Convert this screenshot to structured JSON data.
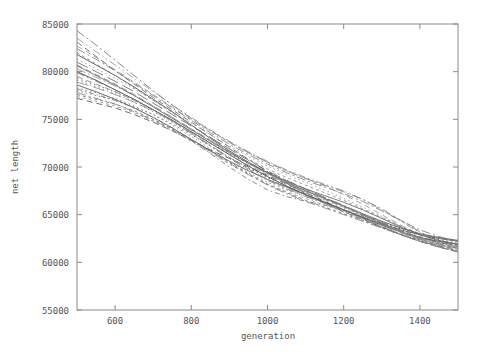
{
  "chart_data": {
    "type": "line",
    "title": "",
    "xlabel": "generation",
    "ylabel": "net length",
    "xlim": [
      500,
      1500
    ],
    "ylim": [
      55000,
      85000
    ],
    "xticks": [
      600,
      800,
      1000,
      1200,
      1400
    ],
    "yticks": [
      55000,
      60000,
      65000,
      70000,
      75000,
      80000,
      85000
    ],
    "xtick_labels": [
      "600",
      "800",
      "1000",
      "1200",
      "1400"
    ],
    "ytick_labels": [
      "55000",
      "60000",
      "65000",
      "70000",
      "75000",
      "80000",
      "85000"
    ],
    "grid": false,
    "legend": false,
    "legend_position": "none",
    "x": [
      500,
      550,
      600,
      650,
      700,
      750,
      800,
      850,
      900,
      950,
      1000,
      1050,
      1100,
      1150,
      1200,
      1250,
      1300,
      1350,
      1400,
      1450,
      1500
    ],
    "series": [
      {
        "name": "run-1",
        "style": "solid",
        "color": "#3a3a3a",
        "values": [
          80000,
          79100,
          78100,
          77100,
          76000,
          74900,
          73700,
          72500,
          71300,
          70100,
          69000,
          68000,
          67100,
          66300,
          65500,
          64700,
          63900,
          63200,
          62600,
          62200,
          61900
        ]
      },
      {
        "name": "run-2",
        "style": "solid",
        "color": "#4a4a4a",
        "values": [
          81800,
          80700,
          79600,
          78400,
          77100,
          75800,
          74400,
          73000,
          71700,
          70500,
          69400,
          68400,
          67500,
          66700,
          65900,
          65100,
          64300,
          63600,
          63000,
          62600,
          62300
        ]
      },
      {
        "name": "run-3",
        "style": "solid",
        "color": "#555555",
        "values": [
          78600,
          77900,
          77100,
          76200,
          75200,
          74100,
          72900,
          71700,
          70600,
          69600,
          68700,
          67900,
          67100,
          66300,
          65500,
          64700,
          64000,
          63400,
          62900,
          62500,
          62200
        ]
      },
      {
        "name": "run-4",
        "style": "dashed",
        "color": "#4a4a4a",
        "values": [
          77200,
          76700,
          76200,
          75500,
          74700,
          73800,
          72800,
          71800,
          70900,
          70000,
          69100,
          68200,
          67300,
          66400,
          65500,
          64600,
          63700,
          62900,
          62200,
          61700,
          61400
        ]
      },
      {
        "name": "run-5",
        "style": "dashed",
        "color": "#5a5a5a",
        "values": [
          83100,
          81600,
          80100,
          78700,
          77300,
          76000,
          74700,
          73400,
          72100,
          70800,
          69500,
          68300,
          67200,
          66200,
          65300,
          64500,
          63700,
          62900,
          62200,
          61600,
          61100
        ]
      },
      {
        "name": "run-6",
        "style": "dotted",
        "color": "#4f4f4f",
        "values": [
          79300,
          78600,
          77900,
          77000,
          76000,
          74900,
          73700,
          72500,
          71400,
          70400,
          69500,
          68600,
          67700,
          66800,
          65900,
          65000,
          64200,
          63500,
          62900,
          62400,
          62000
        ]
      },
      {
        "name": "run-7",
        "style": "dotted",
        "color": "#606060",
        "values": [
          78000,
          77500,
          77000,
          76300,
          75500,
          74500,
          73400,
          72200,
          71000,
          69900,
          68900,
          68000,
          67100,
          66200,
          65300,
          64400,
          63600,
          62900,
          62300,
          61800,
          61500
        ]
      },
      {
        "name": "run-8",
        "style": "dashdot",
        "color": "#6a6a6a",
        "values": [
          84300,
          82800,
          81200,
          79600,
          78000,
          76500,
          75100,
          73800,
          72600,
          71500,
          70500,
          69600,
          68800,
          68100,
          67400,
          66600,
          65600,
          64400,
          63200,
          62300,
          61800
        ]
      },
      {
        "name": "run-9",
        "style": "dashdot",
        "color": "#757575",
        "values": [
          82400,
          81300,
          80100,
          78800,
          77500,
          76200,
          74900,
          73600,
          72400,
          71300,
          70300,
          69400,
          68600,
          67900,
          67200,
          66400,
          65400,
          64400,
          63400,
          62700,
          62200
        ]
      },
      {
        "name": "run-10",
        "style": "longdash",
        "color": "#5e5e5e",
        "values": [
          81000,
          80000,
          79000,
          77900,
          76700,
          75500,
          74300,
          73100,
          71900,
          70700,
          69600,
          68600,
          67700,
          66800,
          65900,
          65000,
          64100,
          63300,
          62600,
          62100,
          61700
        ]
      },
      {
        "name": "run-11",
        "style": "shortdash",
        "color": "#696969",
        "values": [
          77600,
          77100,
          76600,
          75900,
          75000,
          74000,
          72900,
          71700,
          70500,
          69300,
          68200,
          67300,
          66500,
          65800,
          65100,
          64400,
          63700,
          63000,
          62400,
          61900,
          61500
        ]
      },
      {
        "name": "run-12",
        "style": "dashdotdot",
        "color": "#707070",
        "values": [
          79900,
          79000,
          78100,
          77100,
          76000,
          74800,
          73500,
          72200,
          70900,
          69700,
          68600,
          67700,
          66900,
          66200,
          65500,
          64800,
          64000,
          63200,
          62500,
          61900,
          61500
        ]
      },
      {
        "name": "run-13",
        "style": "dashed",
        "color": "#787878",
        "values": [
          80700,
          79700,
          78700,
          77600,
          76400,
          75200,
          74000,
          72800,
          71600,
          70400,
          69300,
          68300,
          67400,
          66600,
          65800,
          65000,
          64100,
          63200,
          62300,
          61600,
          61100
        ]
      },
      {
        "name": "run-14",
        "style": "dotted",
        "color": "#727272",
        "values": [
          78300,
          77800,
          77200,
          76400,
          75500,
          74400,
          73200,
          71900,
          70600,
          69400,
          68400,
          67600,
          66900,
          66200,
          65500,
          64800,
          64000,
          63200,
          62400,
          61700,
          61200
        ]
      },
      {
        "name": "run-15",
        "style": "shortdash",
        "color": "#808080",
        "values": [
          82000,
          80800,
          79600,
          78300,
          77000,
          75700,
          74400,
          73100,
          71900,
          70800,
          69800,
          68900,
          68100,
          67300,
          66500,
          65600,
          64700,
          63800,
          63000,
          62300,
          61800
        ]
      },
      {
        "name": "run-16",
        "style": "dashdot",
        "color": "#7d7d7d",
        "values": [
          77800,
          77200,
          76600,
          75800,
          74900,
          73900,
          72800,
          71600,
          70400,
          69200,
          68100,
          67200,
          66400,
          65700,
          65000,
          64300,
          63600,
          62900,
          62200,
          61600,
          61100
        ]
      },
      {
        "name": "run-17",
        "style": "dashed",
        "color": "#858585",
        "values": [
          79500,
          78700,
          77900,
          77000,
          76000,
          74900,
          73700,
          72500,
          71300,
          70200,
          69200,
          68300,
          67500,
          66700,
          65900,
          65000,
          64100,
          63200,
          62400,
          61700,
          61200
        ]
      },
      {
        "name": "run-18",
        "style": "dotted",
        "color": "#888888",
        "values": [
          81300,
          80300,
          79300,
          78200,
          77000,
          75800,
          74600,
          73400,
          72200,
          71100,
          70100,
          69200,
          68400,
          67600,
          66700,
          65800,
          64800,
          63800,
          62900,
          62200,
          61700
        ]
      },
      {
        "name": "run-19",
        "style": "longdash",
        "color": "#8a8a8a",
        "values": [
          78900,
          78300,
          77600,
          76800,
          75900,
          74800,
          73600,
          72300,
          71000,
          69800,
          68700,
          67800,
          67000,
          66200,
          65400,
          64600,
          63800,
          63100,
          62500,
          62000,
          61600
        ]
      },
      {
        "name": "run-20",
        "style": "dashdotdot",
        "color": "#8d8d8d",
        "values": [
          83500,
          82100,
          80700,
          79300,
          77900,
          76500,
          75200,
          73900,
          72700,
          71600,
          70600,
          69700,
          68900,
          68200,
          67500,
          66600,
          65500,
          64300,
          63100,
          62200,
          61600
        ]
      },
      {
        "name": "run-21",
        "style": "shortdash",
        "color": "#909090",
        "values": [
          77400,
          76900,
          76400,
          75700,
          74800,
          73800,
          72700,
          71500,
          70300,
          69200,
          68200,
          67400,
          66700,
          66000,
          65300,
          64600,
          63900,
          63200,
          62500,
          61900,
          61400
        ]
      },
      {
        "name": "run-22",
        "style": "dashdot",
        "color": "#8f8f8f",
        "values": [
          80300,
          79400,
          78500,
          77500,
          76400,
          75200,
          74000,
          72800,
          71600,
          70400,
          69300,
          68400,
          67600,
          66800,
          66000,
          65100,
          64200,
          63300,
          62500,
          61800,
          61300
        ]
      },
      {
        "name": "run-23",
        "style": "dashed",
        "color": "#929292",
        "values": [
          82700,
          81500,
          80200,
          78900,
          77600,
          76300,
          75000,
          73800,
          72600,
          71500,
          70500,
          69600,
          68800,
          68000,
          67100,
          66100,
          65000,
          63900,
          62900,
          62100,
          61500
        ]
      },
      {
        "name": "run-24",
        "style": "dotted",
        "color": "#7a7a7a",
        "values": [
          79100,
          78400,
          77700,
          76800,
          75800,
          74700,
          73500,
          72200,
          71000,
          69900,
          68900,
          68100,
          67300,
          66500,
          65700,
          64900,
          64100,
          63300,
          62600,
          62000,
          61500
        ]
      },
      {
        "name": "run-25",
        "style": "dip-run",
        "color": "#6e6e6e",
        "values": [
          78200,
          77600,
          77000,
          76200,
          75200,
          74100,
          72800,
          71400,
          70000,
          68700,
          67600,
          66900,
          66400,
          66000,
          65500,
          64900,
          64200,
          63400,
          62700,
          62100,
          61700
        ]
      },
      {
        "name": "run-26",
        "style": "solid",
        "color": "#656565",
        "values": [
          80600,
          79600,
          78600,
          77500,
          76300,
          75100,
          73900,
          72700,
          71500,
          70400,
          69400,
          68500,
          67700,
          67000,
          66300,
          65500,
          64600,
          63700,
          62900,
          62300,
          61900
        ]
      }
    ]
  },
  "axis": {
    "xlabel": "generation",
    "ylabel": "net length"
  }
}
